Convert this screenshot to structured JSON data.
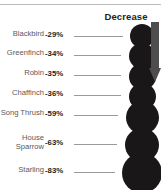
{
  "header": {
    "title": "Decrease"
  },
  "colors": {
    "bubble": "#1a1718",
    "label_text": "#58595b",
    "value_text": "#231f20",
    "leader_line": "#9a9a9a",
    "rule": "#bcbcbc",
    "arrow": "#4d4d4d",
    "background": "#ffffff"
  },
  "icons": {
    "arrow": "arrow-down-icon"
  },
  "chart_data": {
    "type": "bar",
    "title": "Decrease",
    "xlabel": "",
    "ylabel": "",
    "categories": [
      "Blackbird",
      "Greenfinch",
      "Robin",
      "Chaffinch",
      "Song Thrush",
      "House Sparrow",
      "Starling"
    ],
    "values": [
      -29,
      -34,
      -35,
      -36,
      -59,
      -63,
      -83
    ],
    "value_labels": [
      "-29%",
      "-34%",
      "-35%",
      "-36%",
      "-59%",
      "-63%",
      "-83%"
    ],
    "units": "percent",
    "grid": false,
    "legend": null
  },
  "rows": [
    {
      "label": "Blackbird",
      "value": "-29%",
      "label_top": 30,
      "value_top": 30,
      "leader_top": 36,
      "leader_left": 74,
      "leader_width": 49,
      "bubble_cx": 142,
      "bubble_cy": 36,
      "bubble_r": 12
    },
    {
      "label": "Greenfinch",
      "value": "-34%",
      "label_top": 49,
      "value_top": 49,
      "leader_top": 55,
      "leader_left": 74,
      "leader_width": 47,
      "bubble_cx": 142,
      "bubble_cy": 56,
      "bubble_r": 13
    },
    {
      "label": "Robin",
      "value": "-35%",
      "label_top": 69,
      "value_top": 69,
      "leader_top": 75,
      "leader_left": 74,
      "leader_width": 47,
      "bubble_cx": 142,
      "bubble_cy": 76,
      "bubble_r": 13.5
    },
    {
      "label": "Chaffinch",
      "value": "-36%",
      "label_top": 89,
      "value_top": 89,
      "leader_top": 95,
      "leader_left": 74,
      "leader_width": 47,
      "bubble_cx": 142,
      "bubble_cy": 96,
      "bubble_r": 13.5
    },
    {
      "label": "Song Thrush",
      "value": "-59%",
      "label_top": 109,
      "value_top": 109,
      "leader_top": 115,
      "leader_left": 74,
      "leader_width": 44,
      "bubble_cx": 142,
      "bubble_cy": 117,
      "bubble_r": 16.5
    },
    {
      "label": "House\nSparrow",
      "value": "-63%",
      "label_top": 134,
      "value_top": 138,
      "leader_top": 144,
      "leader_left": 74,
      "leader_width": 43,
      "bubble_cx": 142,
      "bubble_cy": 145,
      "bubble_r": 17
    },
    {
      "label": "Starling",
      "value": "-83%",
      "label_top": 166,
      "value_top": 166,
      "leader_top": 172,
      "leader_left": 74,
      "leader_width": 41,
      "bubble_cx": 142,
      "bubble_cy": 173,
      "bubble_r": 20
    }
  ]
}
